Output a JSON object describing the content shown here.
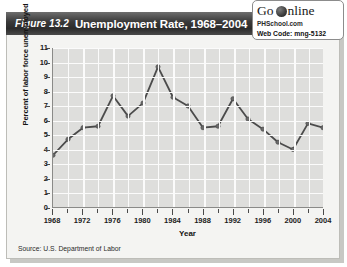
{
  "figure": {
    "number_label": "Figure 13.2",
    "title": "Unemployment Rate, 1968–2004",
    "source": "Source: U.S. Department of Labor"
  },
  "go_online": {
    "go_text": "Go",
    "online_text": "nline",
    "globe_icon": "globe-icon",
    "site": "PHSchool.com",
    "web_code": "Web Code: mng-5132"
  },
  "colors": {
    "banner_dark": "#2b2b2b",
    "plot_background": "#dededc",
    "gridline": "#fbfbfb",
    "series_line": "#4b4b4b",
    "marker": "#6a6a6a",
    "axis": "#8a8a88"
  },
  "chart_data": {
    "type": "line",
    "title": "Unemployment Rate, 1968–2004",
    "xlabel": "Year",
    "ylabel": "Percent of labor force unemployed",
    "xlim": [
      1968,
      2004
    ],
    "ylim": [
      0,
      11
    ],
    "ytick_labels": [
      "0",
      "1",
      "2",
      "3",
      "4",
      "5",
      "6",
      "7",
      "8",
      "9",
      "10",
      "11"
    ],
    "yticks": [
      0,
      1,
      2,
      3,
      4,
      5,
      6,
      7,
      8,
      9,
      10,
      11
    ],
    "xtick_labels": [
      "1968",
      "1972",
      "1976",
      "1980",
      "1984",
      "1988",
      "1992",
      "1996",
      "2000",
      "2004"
    ],
    "xticks_major": [
      1968,
      1972,
      1976,
      1980,
      1984,
      1988,
      1992,
      1996,
      2000,
      2004
    ],
    "xticks_minor": [
      1970,
      1974,
      1978,
      1982,
      1986,
      1990,
      1994,
      1998,
      2002
    ],
    "grid": true,
    "legend": false,
    "x": [
      1968,
      1970,
      1972,
      1974,
      1976,
      1978,
      1980,
      1982,
      1984,
      1986,
      1988,
      1990,
      1992,
      1994,
      1996,
      1998,
      2000,
      2002,
      2004
    ],
    "values": [
      3.6,
      4.7,
      5.5,
      5.6,
      7.7,
      6.3,
      7.2,
      9.7,
      7.6,
      7.0,
      5.5,
      5.6,
      7.5,
      6.1,
      5.4,
      4.5,
      4.0,
      5.8,
      5.5
    ],
    "source": "U.S. Department of Labor"
  }
}
